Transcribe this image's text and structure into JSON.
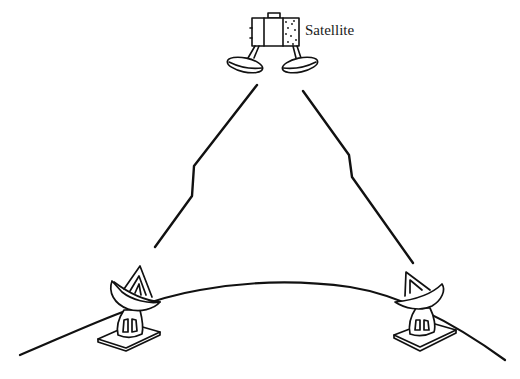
{
  "diagram": {
    "type": "satellite-communication-link",
    "nodes": [
      {
        "id": "satellite",
        "label": "Satellite",
        "icon": "satellite-icon"
      },
      {
        "id": "ground-station-left",
        "label": "",
        "icon": "dish-antenna-icon"
      },
      {
        "id": "ground-station-right",
        "label": "",
        "icon": "dish-antenna-icon"
      }
    ],
    "links": [
      {
        "from": "ground-station-left",
        "to": "satellite",
        "style": "lightning-zigzag"
      },
      {
        "from": "satellite",
        "to": "ground-station-right",
        "style": "lightning-zigzag"
      }
    ],
    "background": "earth-surface-curve",
    "colors": {
      "ink": "#111111",
      "paper": "#ffffff"
    }
  },
  "labels": {
    "satellite": "Satellite"
  }
}
